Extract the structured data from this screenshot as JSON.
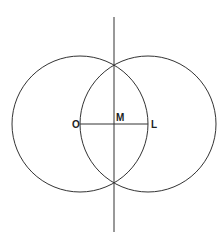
{
  "diagram": {
    "type": "perpendicular-bisector-construction",
    "circles": [
      {
        "center": "O",
        "cx": 80,
        "cy": 124,
        "r": 68
      },
      {
        "center": "L",
        "cx": 148,
        "cy": 124,
        "r": 68
      }
    ],
    "segment": {
      "from": "O",
      "to": "L"
    },
    "bisector": {
      "x": 114,
      "y1": 17,
      "y2": 232
    },
    "points": [
      {
        "label": "O",
        "x": 80,
        "y": 124
      },
      {
        "label": "M",
        "x": 114,
        "y": 124
      },
      {
        "label": "L",
        "x": 148,
        "y": 124
      }
    ],
    "stroke_color": "#333333"
  },
  "labels": {
    "O": "O",
    "M": "M",
    "L": "L"
  }
}
